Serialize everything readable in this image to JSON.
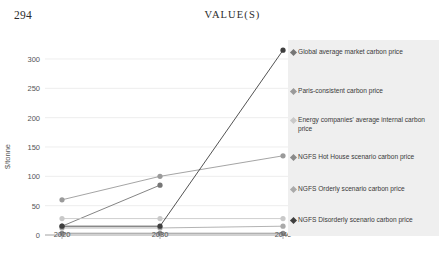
{
  "header": {
    "folio": "294",
    "running_title": "VALUE(S)"
  },
  "chart_data": {
    "type": "line",
    "title": "",
    "xlabel": "",
    "ylabel": "$/tonne",
    "x": [
      "2020",
      "2030",
      "2040"
    ],
    "xlim": [
      2020,
      2040
    ],
    "ylim": [
      0,
      300
    ],
    "yticks": [
      "0",
      "50",
      "100",
      "150",
      "200",
      "250",
      "300"
    ],
    "grid": true,
    "legend_position": "right",
    "series": [
      {
        "name": "Global average market carbon price",
        "color": "#767676",
        "values": [
          15,
          85,
          null
        ]
      },
      {
        "name": "Paris-consistent carbon price",
        "color": "#9a9a9a",
        "values": [
          60,
          100,
          135
        ]
      },
      {
        "name": "Energy companies' average internal carbon price",
        "color": "#c9c9c9",
        "values": [
          28,
          28,
          28
        ]
      },
      {
        "name": "NGFS Hot House scenario carbon price",
        "color": "#8a8a8a",
        "values": [
          3,
          3,
          3
        ]
      },
      {
        "name": "NGFS Orderly scenario carbon price",
        "color": "#aaaaaa",
        "values": [
          12,
          12,
          15
        ]
      },
      {
        "name": "NGFS Disorderly scenario carbon price",
        "color": "#3f3f3f",
        "values": [
          15,
          15,
          315
        ]
      }
    ]
  },
  "legend": {
    "items": [
      {
        "label": "Global average market carbon price",
        "color": "#767676"
      },
      {
        "label": "Paris-consistent carbon price",
        "color": "#9a9a9a"
      },
      {
        "label": "Energy companies' average internal carbon price",
        "color": "#c9c9c9"
      },
      {
        "label": "NGFS Hot House scenario carbon price",
        "color": "#8a8a8a"
      },
      {
        "label": "NGFS Orderly scenario carbon price",
        "color": "#aaaaaa"
      },
      {
        "label": "NGFS Disorderly scenario carbon price",
        "color": "#3f3f3f"
      }
    ]
  }
}
